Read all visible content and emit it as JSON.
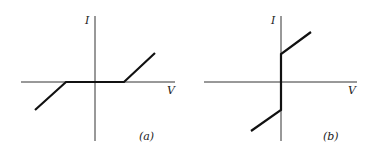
{
  "panels": [
    {
      "id": "a",
      "caption": "(a)",
      "y_axis_label": "I",
      "x_axis_label": "V",
      "description": "I-V characteristic with zero-current dead band around origin; linear slopes outside threshold"
    },
    {
      "id": "b",
      "caption": "(b)",
      "y_axis_label": "I",
      "x_axis_label": "V",
      "description": "I-V characteristic with vertical jump at V=0 and linear slopes beyond"
    }
  ],
  "colors": {
    "curve": "#111111",
    "axis": "#333333",
    "background": "#ffffff"
  }
}
